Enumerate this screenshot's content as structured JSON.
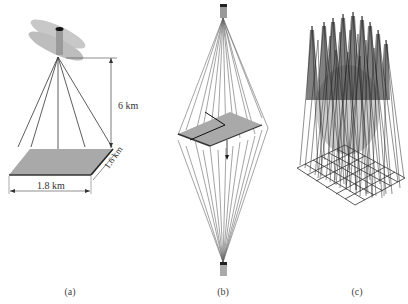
{
  "panels": [
    {
      "id": "a",
      "caption": "(a)",
      "description": "Single satellite imaging a ground patch from altitude",
      "labels": {
        "height": "6 km",
        "width": "1.8 km",
        "depth": "1.6 km"
      }
    },
    {
      "id": "b",
      "caption": "(b)",
      "description": "Two cameras above and below a ground patch with many converging rays"
    },
    {
      "id": "c",
      "caption": "(c)",
      "description": "Grid of ground cells with a cone of rays above each cell"
    }
  ],
  "colors": {
    "line": "#333333",
    "ground": "#a8a8a8",
    "ground_edge": "#3a3a3a",
    "ray": "#555555",
    "satellite_panel": "#c4c4c4",
    "background": "#ffffff"
  }
}
